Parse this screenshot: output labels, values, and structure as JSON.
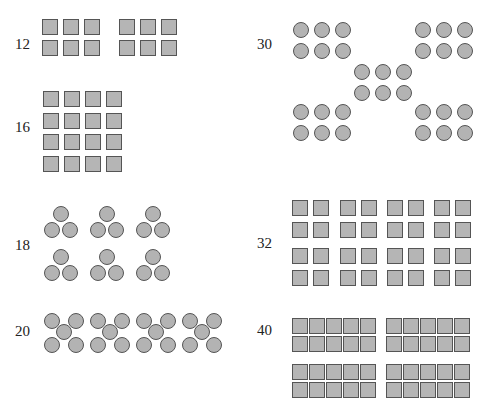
{
  "figure": {
    "shape_fill": "#b5b5b5",
    "shape_stroke": "#555555",
    "groups": [
      {
        "id": "g12",
        "label": "12",
        "shape": "square",
        "arrangement": "2 blocks of 2x3"
      },
      {
        "id": "g16",
        "label": "16",
        "shape": "square",
        "arrangement": "4x4 grid"
      },
      {
        "id": "g18",
        "label": "18",
        "shape": "circle",
        "arrangement": "6 triangles of 3"
      },
      {
        "id": "g20",
        "label": "20",
        "shape": "circle",
        "arrangement": "4 X-patterns of 5"
      },
      {
        "id": "g30",
        "label": "30",
        "shape": "circle",
        "arrangement": "5 blocks of 2x3 in X pattern"
      },
      {
        "id": "g32",
        "label": "32",
        "shape": "square",
        "arrangement": "2x4 blocks of 2x2"
      },
      {
        "id": "g40",
        "label": "40",
        "shape": "square",
        "arrangement": "2x2 blocks of 2x5"
      }
    ]
  }
}
